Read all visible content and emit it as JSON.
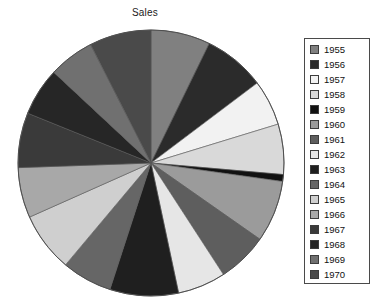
{
  "chart_data": {
    "type": "pie",
    "title": "Sales",
    "xlabel": "",
    "ylabel": "",
    "legend_position": "right",
    "grid": false,
    "start_angle_deg": 90,
    "direction": "clockwise",
    "categories": [
      "1955",
      "1956",
      "1957",
      "1958",
      "1959",
      "1960",
      "1961",
      "1962",
      "1963",
      "1964",
      "1965",
      "1966",
      "1967",
      "1968",
      "1969",
      "1970"
    ],
    "values": [
      26,
      27,
      20,
      22,
      3,
      27,
      22,
      21,
      30,
      22,
      26,
      22,
      24,
      21,
      20,
      27
    ],
    "angles_deg": [
      26,
      27,
      20,
      22,
      3,
      27,
      22,
      21,
      30,
      22,
      26,
      22,
      24,
      21,
      20,
      27
    ],
    "colors": [
      "#808080",
      "#2b2b2b",
      "#f2f2f2",
      "#d9d9d9",
      "#111111",
      "#9b9b9b",
      "#5e5e5e",
      "#e6e6e6",
      "#1f1f1f",
      "#666666",
      "#cfcfcf",
      "#a8a8a8",
      "#3a3a3a",
      "#262626",
      "#707070",
      "#4a4a4a"
    ]
  },
  "title": "Sales",
  "legend": {
    "items": [
      {
        "label": "1955",
        "color": "#808080"
      },
      {
        "label": "1956",
        "color": "#2b2b2b"
      },
      {
        "label": "1957",
        "color": "#f2f2f2"
      },
      {
        "label": "1958",
        "color": "#d9d9d9"
      },
      {
        "label": "1959",
        "color": "#111111"
      },
      {
        "label": "1960",
        "color": "#9b9b9b"
      },
      {
        "label": "1961",
        "color": "#5e5e5e"
      },
      {
        "label": "1962",
        "color": "#e6e6e6"
      },
      {
        "label": "1963",
        "color": "#1f1f1f"
      },
      {
        "label": "1964",
        "color": "#666666"
      },
      {
        "label": "1965",
        "color": "#cfcfcf"
      },
      {
        "label": "1966",
        "color": "#a8a8a8"
      },
      {
        "label": "1967",
        "color": "#3a3a3a"
      },
      {
        "label": "1968",
        "color": "#262626"
      },
      {
        "label": "1969",
        "color": "#707070"
      },
      {
        "label": "1970",
        "color": "#4a4a4a"
      }
    ]
  },
  "geometry": {
    "center_x": 151,
    "center_y": 163,
    "radius": 133
  }
}
